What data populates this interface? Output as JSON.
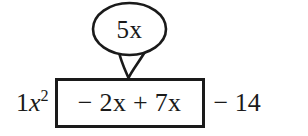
{
  "diagram": {
    "type": "algebra-factoring-annotation",
    "background_color": "#ffffff",
    "ink_color": "#1a1a1a",
    "callout": {
      "shape": "speech-bubble-ellipse",
      "text": "5x",
      "combined_from": [
        "-2x",
        "+7x"
      ],
      "points_to": "grouped-middle-terms"
    },
    "expression": {
      "full": "1x² − 2x + 7x − 14",
      "leading_term": {
        "coefficient": "1",
        "variable": "x",
        "exponent": "2"
      },
      "boxed_group": {
        "text": "− 2x + 7x",
        "first_sign": "−",
        "first_term": "2x",
        "operator": "+",
        "second_term": "7x",
        "border_color": "#1a1a1a"
      },
      "trailing": {
        "sign": "−",
        "value": "14"
      }
    }
  }
}
